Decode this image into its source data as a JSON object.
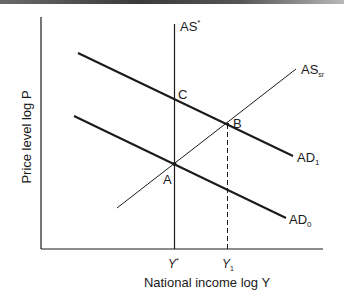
{
  "diagram": {
    "type": "AD-AS economics diagram",
    "x_axis_label": "National income log Y",
    "y_axis_label": "Price level log P",
    "x_ticks": [
      {
        "base": "Y",
        "sup": "*",
        "sub": ""
      },
      {
        "base": "Y",
        "sup": "",
        "sub": "1"
      }
    ],
    "curves": [
      {
        "id": "AS_star",
        "base": "AS",
        "sup": "*",
        "sub": "",
        "kind": "vertical long-run aggregate supply"
      },
      {
        "id": "AS_sr",
        "base": "AS",
        "sup": "",
        "sub": "sr",
        "kind": "short-run aggregate supply"
      },
      {
        "id": "AD_1",
        "base": "AD",
        "sup": "",
        "sub": "1",
        "kind": "aggregate demand (shifted)"
      },
      {
        "id": "AD_0",
        "base": "AD",
        "sup": "",
        "sub": "0",
        "kind": "aggregate demand (initial)"
      }
    ],
    "points": [
      {
        "label": "A",
        "desc": "AD0 ∩ AS* ∩ ASsr"
      },
      {
        "label": "B",
        "desc": "AD1 ∩ ASsr"
      },
      {
        "label": "C",
        "desc": "AD1 ∩ AS*"
      }
    ],
    "colors": {
      "ink": "#1a1a1a",
      "background": "#ffffff"
    }
  }
}
